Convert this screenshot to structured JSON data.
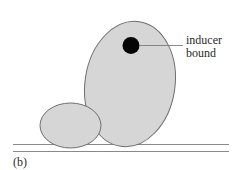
{
  "figure": {
    "panel_label": "(b)",
    "annotation": {
      "line1": "inducer",
      "line2": "bound"
    },
    "colors": {
      "fill": "#d6d6d6",
      "stroke": "#6e6e6e",
      "ligand": "#050505",
      "baseline": "#8a8a8a",
      "text": "#2a2a2a"
    },
    "shapes": {
      "large_subunit": {
        "cx": 130,
        "cy": 84,
        "rx": 45,
        "ry": 63,
        "rotate_deg": 8.5
      },
      "small_subunit": {
        "cx": 70.5,
        "cy": 125.5,
        "rx": 30.5,
        "ry": 22.5
      },
      "inducer": {
        "cx": 131,
        "cy": 45.5,
        "r": 8.5
      },
      "leader_line": {
        "x1": 139,
        "y1": 45.5,
        "x2": 183,
        "y2": 45.5
      },
      "baselines": [
        {
          "x1": 13,
          "x2": 229,
          "y": 144.5
        },
        {
          "x1": 13,
          "x2": 229,
          "y": 151.5
        }
      ]
    }
  }
}
